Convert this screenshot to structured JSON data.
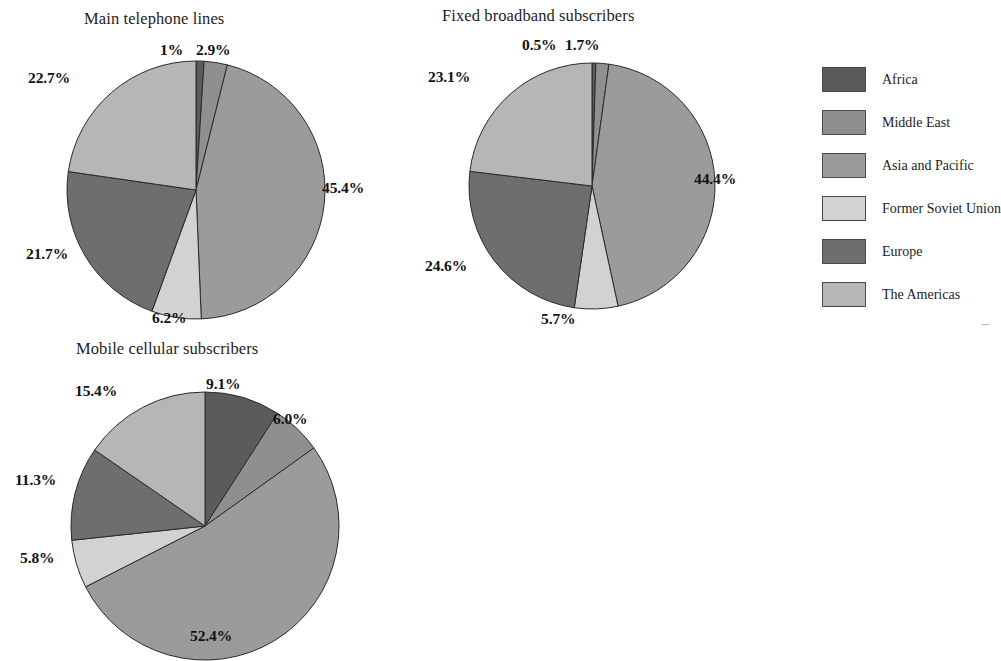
{
  "legend": {
    "items": [
      {
        "label": "Africa",
        "color": "#5b5b5b"
      },
      {
        "label": "Middle East",
        "color": "#8f8f8f"
      },
      {
        "label": "Asia and Pacific",
        "color": "#9b9b9b"
      },
      {
        "label": "Former Soviet Union",
        "color": "#d2d2d2"
      },
      {
        "label": "Europe",
        "color": "#6e6e6e"
      },
      {
        "label": "The Americas",
        "color": "#b6b6b6"
      }
    ]
  },
  "chart_data": [
    {
      "type": "pie",
      "title": "Main telephone lines",
      "categories": [
        "Africa",
        "Middle East",
        "Asia and Pacific",
        "Former Soviet Union",
        "Europe",
        "The Americas"
      ],
      "values": [
        1.0,
        2.9,
        45.4,
        6.2,
        21.7,
        22.7
      ],
      "labels": [
        "1%",
        "2.9%",
        "45.4%",
        "6.2%",
        "21.7%",
        "22.7%"
      ],
      "colors": [
        "#5b5b5b",
        "#8f8f8f",
        "#9b9b9b",
        "#d2d2d2",
        "#6e6e6e",
        "#b6b6b6"
      ],
      "legend_position": "right",
      "start_angle": 0,
      "direction": "clockwise"
    },
    {
      "type": "pie",
      "title": "Fixed broadband subscribers",
      "categories": [
        "Africa",
        "Middle East",
        "Asia and Pacific",
        "Former Soviet Union",
        "Europe",
        "The Americas"
      ],
      "values": [
        0.5,
        1.7,
        44.4,
        5.7,
        24.6,
        23.1
      ],
      "labels": [
        "0.5%",
        "1.7%",
        "44.4%",
        "5.7%",
        "24.6%",
        "23.1%"
      ],
      "colors": [
        "#5b5b5b",
        "#8f8f8f",
        "#9b9b9b",
        "#d2d2d2",
        "#6e6e6e",
        "#b6b6b6"
      ],
      "legend_position": "right",
      "start_angle": 0,
      "direction": "clockwise"
    },
    {
      "type": "pie",
      "title": "Mobile cellular subscribers",
      "categories": [
        "Africa",
        "Middle East",
        "Asia and Pacific",
        "Former Soviet Union",
        "Europe",
        "The Americas"
      ],
      "values": [
        9.1,
        6.0,
        52.4,
        5.8,
        11.3,
        15.4
      ],
      "labels": [
        "9.1%",
        "6.0%",
        "52.4%",
        "5.8%",
        "11.3%",
        "15.4%"
      ],
      "colors": [
        "#5b5b5b",
        "#8f8f8f",
        "#9b9b9b",
        "#d2d2d2",
        "#6e6e6e",
        "#b6b6b6"
      ],
      "legend_position": "right",
      "start_angle": 0,
      "direction": "clockwise"
    }
  ],
  "charts": {
    "telephone": {
      "title": "Main telephone lines",
      "label_africa": "1%",
      "label_middle_east": "2.9%",
      "label_asia_pacific": "45.4%",
      "label_former_soviet": "6.2%",
      "label_europe": "21.7%",
      "label_americas": "22.7%"
    },
    "broadband": {
      "title": "Fixed broadband subscribers",
      "label_africa": "0.5%",
      "label_middle_east": "1.7%",
      "label_asia_pacific": "44.4%",
      "label_former_soviet": "5.7%",
      "label_europe": "24.6%",
      "label_americas": "23.1%"
    },
    "mobile": {
      "title": "Mobile cellular subscribers",
      "label_africa": "9.1%",
      "label_middle_east": "6.0%",
      "label_asia_pacific": "52.4%",
      "label_former_soviet": "5.8%",
      "label_europe": "11.3%",
      "label_americas": "15.4%"
    }
  }
}
